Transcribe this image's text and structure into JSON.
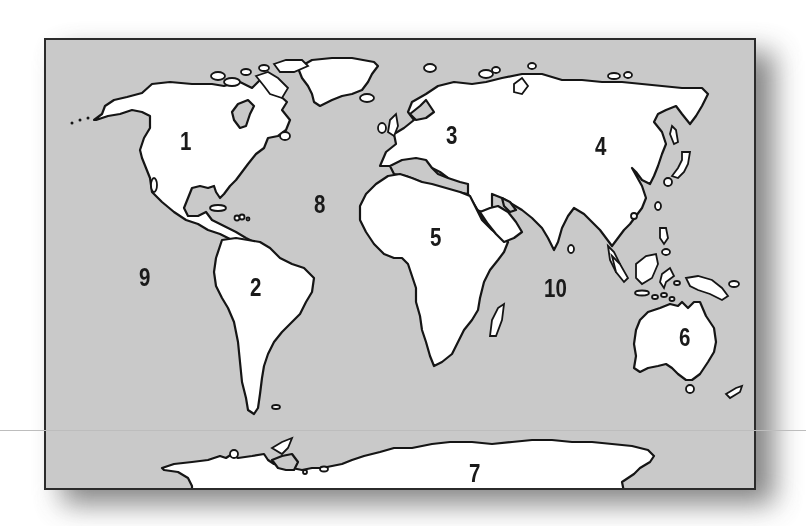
{
  "map": {
    "title": "World map with numbered continents and oceans",
    "colors": {
      "ocean": "#c9c9c9",
      "land": "#ffffff",
      "outline": "#151515",
      "frame": "#2b2b2b"
    },
    "labels": [
      {
        "id": "1",
        "text": "1",
        "region": "North America",
        "x": 178,
        "y": 127
      },
      {
        "id": "2",
        "text": "2",
        "region": "South America",
        "x": 248,
        "y": 273
      },
      {
        "id": "3",
        "text": "3",
        "region": "Europe",
        "x": 444,
        "y": 121
      },
      {
        "id": "4",
        "text": "4",
        "region": "Asia",
        "x": 593,
        "y": 132
      },
      {
        "id": "5",
        "text": "5",
        "region": "Africa",
        "x": 428,
        "y": 223
      },
      {
        "id": "6",
        "text": "6",
        "region": "Australia",
        "x": 677,
        "y": 323
      },
      {
        "id": "7",
        "text": "7",
        "region": "Antarctica",
        "x": 467,
        "y": 459
      },
      {
        "id": "8",
        "text": "8",
        "region": "Atlantic Ocean",
        "x": 312,
        "y": 190
      },
      {
        "id": "9",
        "text": "9",
        "region": "Pacific Ocean",
        "x": 137,
        "y": 263
      },
      {
        "id": "10",
        "text": "10",
        "region": "Indian Ocean",
        "x": 542,
        "y": 274
      }
    ]
  }
}
